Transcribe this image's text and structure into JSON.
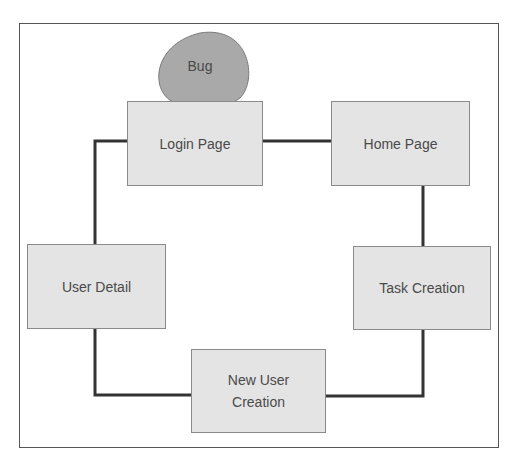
{
  "diagram": {
    "type": "flow-cycle",
    "callout": {
      "label": "Bug",
      "attached_to": "Login Page",
      "fill": "#a9a9a9"
    },
    "nodes": [
      {
        "id": "login",
        "label": "Login Page"
      },
      {
        "id": "home",
        "label": "Home Page"
      },
      {
        "id": "task",
        "label": "Task Creation"
      },
      {
        "id": "newuser",
        "label": "New User Creation"
      },
      {
        "id": "userdetail",
        "label": "User Detail"
      }
    ],
    "edges": [
      {
        "from": "login",
        "to": "home"
      },
      {
        "from": "home",
        "to": "task"
      },
      {
        "from": "task",
        "to": "newuser"
      },
      {
        "from": "newuser",
        "to": "userdetail"
      },
      {
        "from": "userdetail",
        "to": "login"
      }
    ],
    "colors": {
      "node_fill": "#e4e4e4",
      "node_border": "#8a8a8a",
      "line": "#333333",
      "text": "#4a4a4a"
    }
  }
}
